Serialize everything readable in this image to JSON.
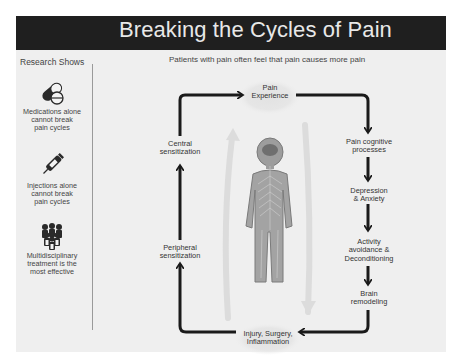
{
  "header": {
    "title": "Breaking the Cycles of Pain"
  },
  "sidebar": {
    "heading": "Research Shows",
    "items": [
      {
        "icon": "pills-icon",
        "line1": "Medications alone",
        "line2": "cannot break",
        "line3": "pain cycles"
      },
      {
        "icon": "syringe-icon",
        "line1": "Injections alone",
        "line2": "cannot break",
        "line3": "pain cycles"
      },
      {
        "icon": "team-icon",
        "line1": "Multidisciplinary",
        "line2": "treatment is the",
        "line3": "most effective"
      }
    ]
  },
  "diagram": {
    "subtitle": "Patients with pain often feel that  pain causes more pain",
    "nodes": {
      "pain_experience": {
        "line1": "Pain",
        "line2": "Experience"
      },
      "pain_cognitive": {
        "line1": "Pain cognitive",
        "line2": "processes"
      },
      "depression": {
        "line1": "Depression",
        "line2": "& Anxiety"
      },
      "activity": {
        "line1": "Activity",
        "line2": "avoidance &",
        "line3": "Deconditioning"
      },
      "brain": {
        "line1": "Brain",
        "line2": "remodeling"
      },
      "injury": {
        "line1": "Injury, Surgery,",
        "line2": "Inflammation"
      },
      "peripheral": {
        "line1": "Peripheral",
        "line2": "sensitization"
      },
      "central": {
        "line1": "Central",
        "line2": "sensitization"
      }
    },
    "center_image": "nervous-system-figure",
    "colors": {
      "header_bg": "#1f1f1f",
      "panel_bg": "#efefef",
      "arrow": "#1a1a1a",
      "faint_arrow": "#dcdcdc"
    }
  }
}
